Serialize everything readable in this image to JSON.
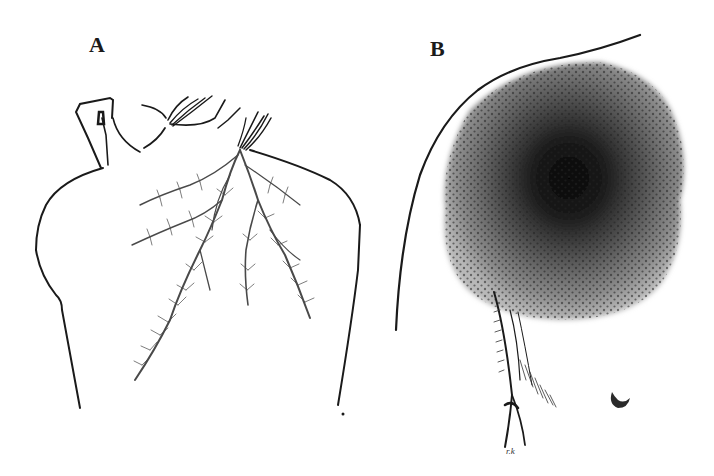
{
  "figure": {
    "panels": [
      {
        "label": "A",
        "subject": "back-with-branching-fern-pattern",
        "description": "Line drawing of a person's back and neck from behind, hand raised to the head, with dendritic branching marks radiating down the upper back from the base of the neck"
      },
      {
        "label": "B",
        "subject": "shoulder-with-circular-stippled-mark",
        "description": "Line drawing of a shoulder/chest outline with a large round dark stippled mark, darkest at center, plus axillary folds and a nipple below"
      }
    ],
    "signature": "r.k",
    "colors": {
      "background": "#ffffff",
      "line": "#1a1a1a",
      "mark_outer": "#8a8a8a",
      "mark_center": "#0a0a0a"
    }
  }
}
